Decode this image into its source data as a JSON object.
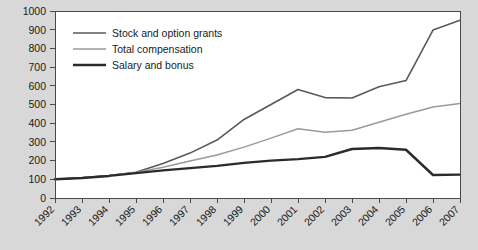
{
  "chart_data": {
    "type": "line",
    "title": "",
    "subtitle": "",
    "xlabel": "",
    "ylabel": "",
    "categories": [
      "1992",
      "1993",
      "1994",
      "1995",
      "1996",
      "1997",
      "1998",
      "1999",
      "2000",
      "2001",
      "2002",
      "2003",
      "2004",
      "2005",
      "2006",
      "2007"
    ],
    "x": [
      1992,
      1993,
      1994,
      1995,
      1996,
      1997,
      1998,
      1999,
      2000,
      2001,
      2002,
      2003,
      2004,
      2005,
      2006,
      2007
    ],
    "xlim": [
      1992,
      2007
    ],
    "ylim": [
      0,
      1000
    ],
    "yticks": [
      0,
      100,
      200,
      300,
      400,
      500,
      600,
      700,
      800,
      900,
      1000
    ],
    "ytick_labels": [
      "0",
      "100",
      "200",
      "300",
      "400",
      "500",
      "600",
      "700",
      "800",
      "900",
      "1000"
    ],
    "grid": false,
    "legend_position": "upper-left",
    "series": [
      {
        "name": "Stock and option grants",
        "color": "#595959",
        "width": 1.6,
        "values": [
          100,
          108,
          120,
          138,
          185,
          240,
          310,
          420,
          500,
          580,
          537,
          535,
          595,
          628,
          898,
          950
        ]
      },
      {
        "name": "Total compensation",
        "color": "#9a9a9a",
        "width": 1.5,
        "values": [
          100,
          108,
          120,
          136,
          165,
          198,
          230,
          272,
          320,
          370,
          352,
          362,
          405,
          448,
          487,
          505
        ]
      },
      {
        "name": "Salary and bonus",
        "color": "#2b2b2b",
        "width": 2.4,
        "values": [
          100,
          107,
          118,
          133,
          148,
          160,
          172,
          188,
          200,
          208,
          220,
          262,
          267,
          258,
          123,
          125
        ]
      }
    ]
  },
  "colors": {
    "page_background": "#d8d8d8",
    "plot_background": "#ffffff",
    "axis": "#4a4a4a",
    "text": "#1a1a1a"
  },
  "axes": {
    "y_axis_name": "value-axis",
    "x_axis_name": "year-axis"
  }
}
